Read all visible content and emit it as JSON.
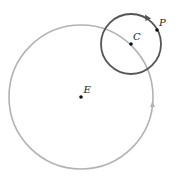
{
  "diagram": {
    "width": 178,
    "height": 180,
    "large_circle": {
      "center_label": "E",
      "cx": 81,
      "cy": 97,
      "r": 72,
      "stroke": "#b3b3b3",
      "arrow_at": [
        152,
        104
      ],
      "direction": "counterclockwise"
    },
    "small_circle": {
      "center_label": "C",
      "cx": 131,
      "cy": 44,
      "r": 30,
      "stroke": "#555555",
      "arrow_at": [
        148,
        18
      ],
      "direction": "clockwise"
    },
    "points": [
      {
        "label": "E",
        "x": 81,
        "y": 97
      },
      {
        "label": "C",
        "x": 131,
        "y": 44
      },
      {
        "label": "P",
        "x": 157,
        "y": 30
      }
    ],
    "labels": {
      "E": "E",
      "C": "C",
      "P": "P"
    },
    "colors": {
      "large_circle": "#b3b3b3",
      "small_circle": "#555555",
      "points": "#111111"
    }
  }
}
